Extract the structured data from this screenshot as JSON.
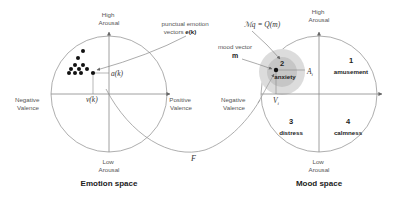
{
  "emotion_space": {
    "title": "Emotion space",
    "axis_top": [
      "High",
      "Arousal"
    ],
    "axis_bottom": [
      "Low",
      "Arousal"
    ],
    "axis_left": [
      "Negative",
      "Valence"
    ],
    "axis_right": [
      "Positive",
      "Valence"
    ],
    "annotation": [
      "punctual emotion",
      "vectors "
    ],
    "annotation_math": "e(k)",
    "arousal_label": "a(k)",
    "valence_label": "v(k)"
  },
  "mood_space": {
    "title": "Mood space",
    "axis_top": [
      "High",
      "Arousal"
    ],
    "axis_bottom": [
      "Low",
      "Arousal"
    ],
    "axis_left": [
      "Negative",
      "Valence"
    ],
    "formula": "ℳq = Q(m)",
    "mood_vector_label": "mood vector",
    "mood_vector_symbol": "m",
    "arousal_label": "A",
    "arousal_sub": "i",
    "valence_label": "V",
    "valence_sub": "i",
    "quadrants": [
      {
        "number": "1",
        "name": "amusement"
      },
      {
        "number": "2",
        "name": "anxiety"
      },
      {
        "number": "3",
        "name": "distress"
      },
      {
        "number": "4",
        "name": "calmness"
      }
    ]
  },
  "mapping": {
    "label": "F"
  },
  "colors": {
    "line": "#888888",
    "axis": "#8a8a8a",
    "dot": "#111111",
    "highlight_outer": "#d8d8d8",
    "highlight_inner": "#c2c2c2"
  }
}
